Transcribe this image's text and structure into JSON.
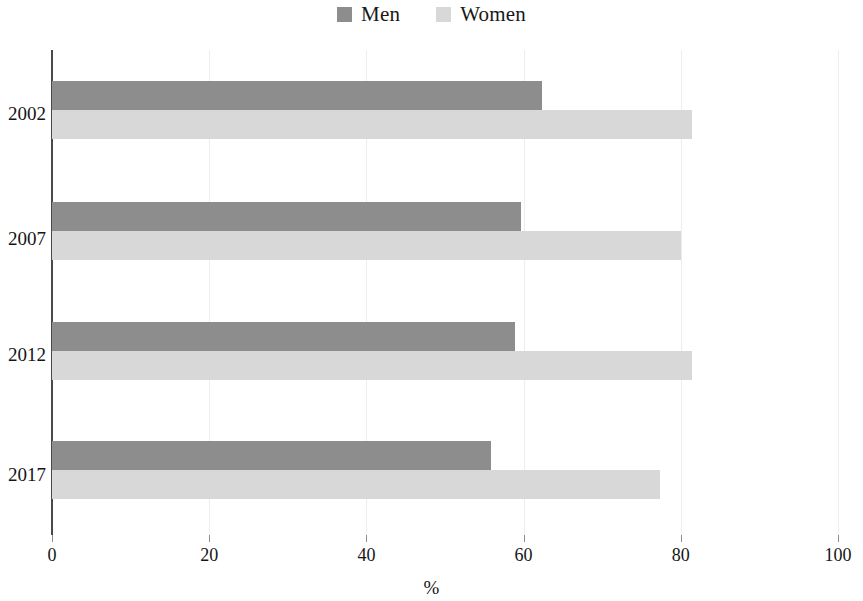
{
  "legend": {
    "position": "top-center",
    "items": [
      {
        "label": "Men",
        "color": "#8d8d8d",
        "swatch_name": "legend-swatch-men"
      },
      {
        "label": "Women",
        "color": "#d8d8d8",
        "swatch_name": "legend-swatch-women"
      }
    ]
  },
  "axis": {
    "x_title": "%",
    "x_ticks": [
      "0",
      "20",
      "40",
      "60",
      "80",
      "100"
    ],
    "y_ticks": [
      "2002",
      "2007",
      "2012",
      "2017"
    ]
  },
  "chart_data": {
    "type": "bar",
    "orientation": "horizontal",
    "title": "",
    "subtitle": "",
    "xlabel": "%",
    "ylabel": "",
    "xlim": [
      0,
      100
    ],
    "xticks": [
      0,
      20,
      40,
      60,
      80,
      100
    ],
    "grid": "vertical-light",
    "legend_position": "top-center",
    "categories": [
      "2002",
      "2007",
      "2012",
      "2017"
    ],
    "series": [
      {
        "name": "Men",
        "color": "#8d8d8d",
        "values": [
          62.3,
          59.7,
          58.9,
          55.8
        ]
      },
      {
        "name": "Women",
        "color": "#d8d8d8",
        "values": [
          81.4,
          80.0,
          81.4,
          77.4
        ]
      }
    ]
  }
}
